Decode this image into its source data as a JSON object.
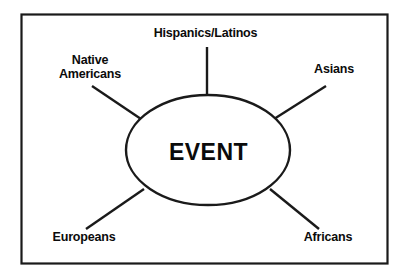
{
  "diagram": {
    "type": "spoke-diagram",
    "center": {
      "label": "EVENT",
      "shape": "ellipse"
    },
    "border": {
      "color": "#1a1a1a",
      "style": "solid rectangle"
    },
    "line_color": "#1a1a1a",
    "background_color": "#ffffff",
    "text_color": "#0b0b0b",
    "spokes": [
      {
        "id": "hispanics-latinos",
        "label": "Hispanics/Latinos",
        "position": "top",
        "connector": "vertical"
      },
      {
        "id": "native-americans",
        "label_line1": "Native",
        "label_line2": "Americans",
        "label": "Native Americans",
        "position": "top-left",
        "connector": "diagonal"
      },
      {
        "id": "asians",
        "label": "Asians",
        "position": "top-right",
        "connector": "diagonal"
      },
      {
        "id": "europeans",
        "label": "Europeans",
        "position": "bottom-left",
        "connector": "diagonal"
      },
      {
        "id": "africans",
        "label": "Africans",
        "position": "bottom-right",
        "connector": "diagonal"
      }
    ]
  }
}
